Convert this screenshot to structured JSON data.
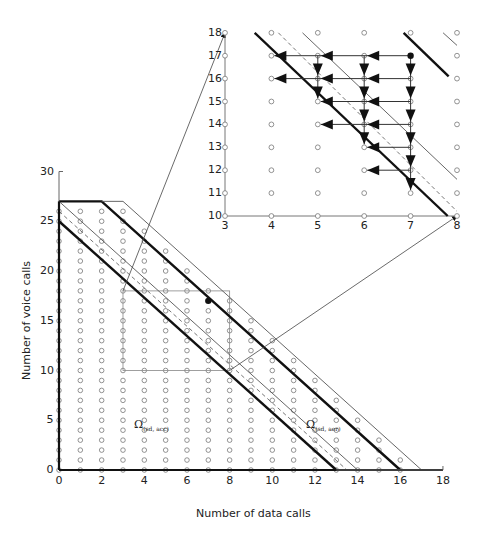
{
  "chart_data": {
    "type": "scatter",
    "main": {
      "xlabel": "Number of data calls",
      "ylabel": "Number of voice calls",
      "xlim": [
        0,
        18
      ],
      "ylim": [
        0,
        30
      ],
      "xticks": [
        0,
        2,
        4,
        6,
        8,
        10,
        12,
        14,
        16,
        18
      ],
      "yticks": [
        0,
        5,
        10,
        15,
        20,
        25,
        30
      ],
      "lattice_marker": "open-diamond-circle",
      "highlight_point": [
        7,
        17
      ],
      "zoom_box": {
        "x": [
          3,
          8
        ],
        "y": [
          10,
          18
        ]
      },
      "lines": [
        {
          "name": "boundary-acc",
          "style": "thick",
          "points": [
            [
              0,
              25
            ],
            [
              13,
              0
            ]
          ]
        },
        {
          "name": "boundary-aer",
          "style": "thick",
          "points": [
            [
              0,
              27
            ],
            [
              2,
              27
            ],
            [
              16,
              0
            ]
          ]
        },
        {
          "name": "inner-thin",
          "style": "thin",
          "points": [
            [
              0,
              27
            ],
            [
              14,
              0
            ]
          ]
        },
        {
          "name": "inner-dashed",
          "style": "dashed",
          "points": [
            [
              0,
              26
            ],
            [
              13.5,
              0
            ]
          ]
        },
        {
          "name": "outer-thin",
          "style": "thin",
          "points": [
            [
              2,
              27
            ],
            [
              3,
              27
            ],
            [
              17,
              0
            ]
          ]
        }
      ],
      "region_labels": [
        {
          "text": "Ω",
          "sub": "(sd, acc)",
          "at": [
            3.5,
            4.5
          ]
        },
        {
          "text": "Ω",
          "sub": "(sd, aer)",
          "at": [
            11.5,
            4.5
          ]
        }
      ]
    },
    "inset": {
      "xlim": [
        3,
        8
      ],
      "ylim": [
        10,
        18
      ],
      "xticks": [
        3,
        4,
        5,
        6,
        7,
        8
      ],
      "yticks": [
        10,
        11,
        12,
        13,
        14,
        15,
        16,
        17,
        18
      ],
      "start_point": [
        7,
        17
      ],
      "horizontal_arrows": [
        {
          "y": 17,
          "from": 7,
          "to": 4
        },
        {
          "y": 16,
          "from": 7,
          "to": 4
        },
        {
          "y": 15,
          "from": 7,
          "to": 5
        },
        {
          "y": 14,
          "from": 7,
          "to": 5
        },
        {
          "y": 13,
          "from": 7,
          "to": 6
        },
        {
          "y": 12,
          "from": 7,
          "to": 6
        }
      ],
      "vertical_arrows": [
        {
          "x": 5,
          "from": 17,
          "to": 15
        },
        {
          "x": 6,
          "from": 17,
          "to": 13
        },
        {
          "x": 7,
          "from": 17,
          "to": 11
        }
      ]
    }
  },
  "labels": {
    "xlabel": "Number of data calls",
    "ylabel": "Number of voice calls",
    "omega_acc": "Ω",
    "omega_acc_sub": "(sd, acc)",
    "omega_aer": "Ω",
    "omega_aer_sub": "(sd, aer)"
  },
  "ticks": {
    "x": [
      "0",
      "2",
      "4",
      "6",
      "8",
      "10",
      "12",
      "14",
      "16",
      "18"
    ],
    "y": [
      "0",
      "5",
      "10",
      "15",
      "20",
      "25",
      "30"
    ],
    "ix": [
      "3",
      "4",
      "5",
      "6",
      "7",
      "8"
    ],
    "iy": [
      "10",
      "11",
      "12",
      "13",
      "14",
      "15",
      "16",
      "17",
      "18"
    ]
  }
}
